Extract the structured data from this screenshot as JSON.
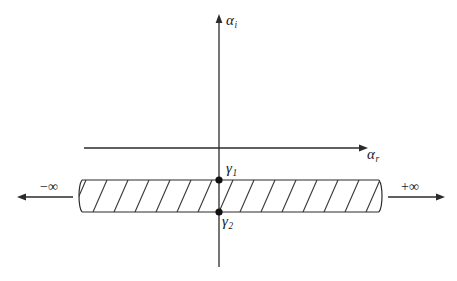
{
  "figure": {
    "type": "complex-plane-branch-cut-diagram",
    "background_color": "#ffffff",
    "line_color": "#2b2b2b",
    "hatch_color": "#3a3a3a"
  },
  "axes": {
    "vertical": {
      "label": "α",
      "subscript": "i",
      "name": "imaginary-axis",
      "x": 219,
      "y_top": 14,
      "y_bottom": 267,
      "arrow": "up"
    },
    "horizontal": {
      "label": "α",
      "subscript": "r",
      "name": "real-axis",
      "y": 148,
      "x_left": 84,
      "x_right": 368,
      "arrow": "right"
    }
  },
  "band": {
    "name": "branch-cut-strip",
    "x_left": 78,
    "x_right": 383,
    "y_top": 180,
    "y_bottom": 212,
    "hatch_spacing": 21,
    "hatch_slope_dx": 14,
    "break_ends": "both"
  },
  "points": [
    {
      "label": "γ",
      "subscript": "1",
      "name": "gamma-1",
      "x": 219,
      "y": 180
    },
    {
      "label": "γ",
      "subscript": "2",
      "name": "gamma-2",
      "x": 219,
      "y": 212
    }
  ],
  "annotations": {
    "left": {
      "text": "−∞",
      "arrow_direction": "left",
      "arrow_x_start": 73,
      "arrow_x_end": 17,
      "arrow_y": 197
    },
    "right": {
      "text": "+∞",
      "arrow_direction": "right",
      "arrow_x_start": 388,
      "arrow_x_end": 445,
      "arrow_y": 197
    }
  }
}
